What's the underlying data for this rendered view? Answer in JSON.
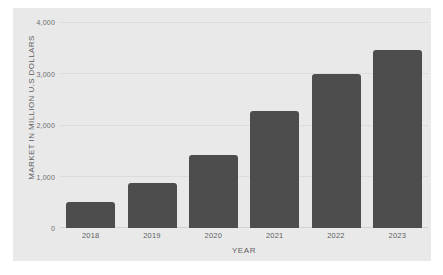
{
  "chart_data": {
    "type": "bar",
    "title": "",
    "subtitle": "",
    "xlabel": "YEAR",
    "ylabel": "MARKET IN MILLION U.S DOLLARS",
    "categories": [
      "2018",
      "2019",
      "2020",
      "2021",
      "2022",
      "2023"
    ],
    "values": [
      500,
      880,
      1420,
      2280,
      2990,
      3450
    ],
    "series": [
      {
        "name": "Market size",
        "values": [
          500,
          880,
          1420,
          2280,
          2990,
          3450
        ]
      }
    ],
    "ylim": [
      0,
      4000
    ],
    "yticks": [
      0,
      1000,
      2000,
      3000,
      4000
    ],
    "ytick_labels": [
      "0",
      "1,000",
      "2,000",
      "3,000",
      "4,000"
    ],
    "grid": true,
    "grid_axis": "y",
    "legend": false,
    "legend_position": "none",
    "bar_color": "#4d4d4d",
    "plot_background": "#e9e9e9",
    "page_background": "#ffffff",
    "gridline_color": "#dcdcdc",
    "tick_label_color": "#6e6e6e",
    "axis_title_color": "#5e5e5e"
  }
}
